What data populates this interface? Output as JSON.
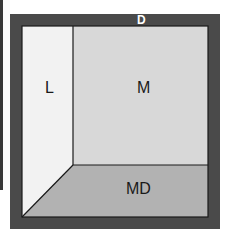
{
  "diagram": {
    "title_label": "D",
    "regions": [
      {
        "id": "L",
        "label": "L",
        "color": "#f2f2f2"
      },
      {
        "id": "M",
        "label": "M",
        "color": "#d8d8d8"
      },
      {
        "id": "MD",
        "label": "MD",
        "color": "#b2b2b2"
      }
    ],
    "frame_color": "#4a4a4a",
    "line_color": "#1a1a1a"
  }
}
